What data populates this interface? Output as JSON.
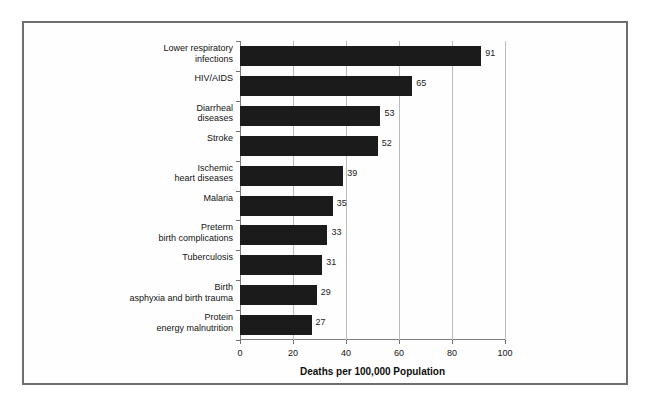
{
  "chart_data": {
    "type": "bar",
    "orientation": "horizontal",
    "title": "",
    "xlabel": "Deaths per 100,000 Population",
    "ylabel": "",
    "xlim": [
      0,
      100
    ],
    "xticks": [
      0,
      20,
      40,
      60,
      80,
      100
    ],
    "xtick_labels": [
      "0",
      "20",
      "40",
      "60",
      "80",
      "100"
    ],
    "grid": true,
    "grid_axis": "x",
    "legend": false,
    "bar_color": "#1b1b1b",
    "categories": [
      "Lower respiratory\ninfections",
      "HIV/AIDS",
      "Diarrheal\ndiseases",
      "Stroke",
      "Ischemic\nheart diseases",
      "Malaria",
      "Preterm\nbirth complications",
      "Tuberculosis",
      "Birth\nasphyxia and birth trauma",
      "Protein\nenergy malnutrition"
    ],
    "values": [
      91,
      65,
      53,
      52,
      39,
      35,
      33,
      31,
      29,
      27
    ],
    "value_labels": [
      "91",
      "65",
      "53",
      "52",
      "39",
      "35",
      "33",
      "31",
      "29",
      "27"
    ]
  }
}
